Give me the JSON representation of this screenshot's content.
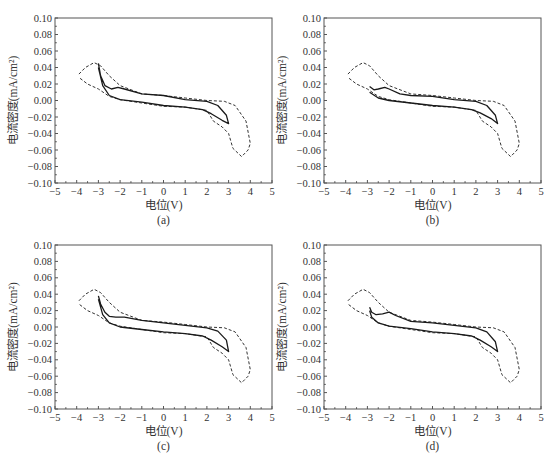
{
  "figure": {
    "axes_common": {
      "xlabel": "电位(V)",
      "ylabel": "电流密度(mA/cm²)",
      "xlim": [
        -5,
        5
      ],
      "ylim": [
        -0.1,
        0.1
      ],
      "x_ticks": [
        -5,
        -4,
        -3,
        -2,
        -1,
        0,
        1,
        2,
        3,
        4,
        5
      ],
      "x_tick_labels": [
        "−5",
        "−4",
        "−3",
        "−2",
        "−1",
        "0",
        "1",
        "2",
        "3",
        "4",
        "5"
      ],
      "y_ticks": [
        0.1,
        0.08,
        0.06,
        0.04,
        0.02,
        0.0,
        -0.02,
        -0.04,
        -0.06,
        -0.08,
        -0.1
      ],
      "y_tick_labels": [
        "0.10",
        "0.08",
        "0.06",
        "0.04",
        "0.02",
        "0.00",
        "−0.02",
        "−0.04",
        "−0.06",
        "−0.08",
        "−0.10"
      ]
    },
    "panels": [
      {
        "caption": "(a)"
      },
      {
        "caption": "(b)"
      },
      {
        "caption": "(c)"
      },
      {
        "caption": "(d)"
      }
    ]
  },
  "chart_data": [
    {
      "type": "line",
      "title": "(a)",
      "xlabel": "电位(V)",
      "ylabel": "电流密度(mA/cm²)",
      "xlim": [
        -5,
        5
      ],
      "ylim": [
        -0.1,
        0.1
      ],
      "grid": false,
      "legend": "none",
      "series": [
        {
          "name": "dashed",
          "style": "dashed",
          "x": [
            -3.9,
            -3.6,
            -3.2,
            -2.9,
            -2.5,
            -2.0,
            -1.0,
            0.0,
            1.0,
            2.0,
            2.8,
            3.3,
            3.8,
            4.0,
            3.9,
            3.6,
            3.2,
            3.0,
            2.7,
            2.3,
            2.0,
            1.0,
            0.0,
            -1.0,
            -2.0,
            -2.5,
            -3.0,
            -3.5,
            -3.9
          ],
          "y": [
            0.032,
            0.04,
            0.046,
            0.042,
            0.03,
            0.018,
            0.008,
            0.006,
            0.003,
            0.0,
            -0.001,
            -0.006,
            -0.025,
            -0.052,
            -0.06,
            -0.068,
            -0.058,
            -0.04,
            -0.032,
            -0.025,
            -0.012,
            -0.008,
            -0.007,
            -0.003,
            0.001,
            0.005,
            0.014,
            0.02,
            0.028
          ]
        },
        {
          "name": "solid",
          "style": "solid",
          "x": [
            -3.0,
            -2.9,
            -2.7,
            -2.4,
            -2.1,
            -1.8,
            -1.0,
            0.0,
            1.0,
            2.0,
            2.5,
            2.9,
            3.0,
            2.7,
            2.2,
            1.8,
            1.0,
            0.0,
            -1.0,
            -2.0,
            -2.5,
            -2.8,
            -3.0
          ],
          "y": [
            0.045,
            0.03,
            0.018,
            0.014,
            0.016,
            0.014,
            0.008,
            0.006,
            0.001,
            -0.001,
            -0.006,
            -0.018,
            -0.028,
            -0.024,
            -0.016,
            -0.011,
            -0.008,
            -0.006,
            -0.002,
            0.001,
            0.006,
            0.018,
            0.04
          ]
        }
      ]
    },
    {
      "type": "line",
      "title": "(b)",
      "xlabel": "电位(V)",
      "ylabel": "电流密度(mA/cm²)",
      "xlim": [
        -5,
        5
      ],
      "ylim": [
        -0.1,
        0.1
      ],
      "grid": false,
      "legend": "none",
      "series": [
        {
          "name": "dashed",
          "style": "dashed",
          "x": [
            -3.9,
            -3.6,
            -3.2,
            -2.9,
            -2.5,
            -2.0,
            -1.0,
            0.0,
            1.0,
            2.0,
            2.8,
            3.3,
            3.8,
            4.0,
            3.9,
            3.6,
            3.2,
            3.0,
            2.7,
            2.3,
            2.0,
            1.0,
            0.0,
            -1.0,
            -2.0,
            -2.5,
            -3.0,
            -3.5,
            -3.9
          ],
          "y": [
            0.032,
            0.04,
            0.046,
            0.042,
            0.03,
            0.018,
            0.008,
            0.006,
            0.003,
            0.0,
            -0.001,
            -0.006,
            -0.025,
            -0.052,
            -0.06,
            -0.068,
            -0.058,
            -0.04,
            -0.032,
            -0.025,
            -0.012,
            -0.008,
            -0.007,
            -0.003,
            0.001,
            0.005,
            0.014,
            0.02,
            0.028
          ]
        },
        {
          "name": "solid",
          "style": "solid",
          "x": [
            -2.9,
            -2.7,
            -2.5,
            -2.2,
            -2.0,
            -1.5,
            -1.0,
            0.0,
            1.0,
            2.0,
            2.5,
            2.9,
            3.0,
            2.7,
            2.2,
            1.8,
            1.0,
            0.0,
            -1.0,
            -2.0,
            -2.5,
            -2.9
          ],
          "y": [
            0.017,
            0.013,
            0.014,
            0.016,
            0.014,
            0.008,
            0.006,
            0.005,
            0.001,
            -0.001,
            -0.006,
            -0.018,
            -0.028,
            -0.022,
            -0.015,
            -0.011,
            -0.008,
            -0.006,
            -0.003,
            0.0,
            0.003,
            0.01
          ]
        }
      ]
    },
    {
      "type": "line",
      "title": "(c)",
      "xlabel": "电位(V)",
      "ylabel": "电流密度(mA/cm²)",
      "xlim": [
        -5,
        5
      ],
      "ylim": [
        -0.1,
        0.1
      ],
      "grid": false,
      "legend": "none",
      "series": [
        {
          "name": "dashed",
          "style": "dashed",
          "x": [
            -3.9,
            -3.6,
            -3.2,
            -2.9,
            -2.5,
            -2.0,
            -1.0,
            0.0,
            1.0,
            2.0,
            2.8,
            3.3,
            3.8,
            4.0,
            3.9,
            3.6,
            3.2,
            3.0,
            2.7,
            2.3,
            2.0,
            1.0,
            0.0,
            -1.0,
            -2.0,
            -2.5,
            -3.0,
            -3.5,
            -3.9
          ],
          "y": [
            0.032,
            0.04,
            0.046,
            0.042,
            0.03,
            0.018,
            0.008,
            0.006,
            0.003,
            0.0,
            -0.001,
            -0.006,
            -0.025,
            -0.052,
            -0.06,
            -0.068,
            -0.058,
            -0.04,
            -0.032,
            -0.025,
            -0.012,
            -0.008,
            -0.007,
            -0.003,
            0.001,
            0.005,
            0.014,
            0.02,
            0.028
          ]
        },
        {
          "name": "solid",
          "style": "solid",
          "x": [
            -3.0,
            -2.9,
            -2.7,
            -2.5,
            -2.2,
            -1.8,
            -1.0,
            0.0,
            1.0,
            2.0,
            2.5,
            2.9,
            3.0,
            2.7,
            2.2,
            1.8,
            1.0,
            0.0,
            -1.0,
            -2.0,
            -2.5,
            -2.8,
            -3.0
          ],
          "y": [
            0.038,
            0.028,
            0.018,
            0.013,
            0.012,
            0.012,
            0.008,
            0.005,
            0.002,
            -0.001,
            -0.005,
            -0.016,
            -0.03,
            -0.024,
            -0.016,
            -0.011,
            -0.008,
            -0.006,
            -0.003,
            0.0,
            0.005,
            0.015,
            0.034
          ]
        }
      ]
    },
    {
      "type": "line",
      "title": "(d)",
      "xlabel": "电位(V)",
      "ylabel": "电流密度(mA/cm²)",
      "xlim": [
        -5,
        5
      ],
      "ylim": [
        -0.1,
        0.1
      ],
      "grid": false,
      "legend": "none",
      "series": [
        {
          "name": "dashed",
          "style": "dashed",
          "x": [
            -3.9,
            -3.6,
            -3.2,
            -2.9,
            -2.5,
            -2.0,
            -1.0,
            0.0,
            1.0,
            2.0,
            2.8,
            3.3,
            3.8,
            4.0,
            3.9,
            3.6,
            3.2,
            3.0,
            2.7,
            2.3,
            2.0,
            1.0,
            0.0,
            -1.0,
            -2.0,
            -2.5,
            -3.0,
            -3.5,
            -3.9
          ],
          "y": [
            0.032,
            0.04,
            0.046,
            0.042,
            0.03,
            0.018,
            0.008,
            0.006,
            0.003,
            0.0,
            -0.001,
            -0.006,
            -0.025,
            -0.052,
            -0.06,
            -0.068,
            -0.058,
            -0.04,
            -0.032,
            -0.025,
            -0.012,
            -0.008,
            -0.007,
            -0.003,
            0.001,
            0.005,
            0.014,
            0.02,
            0.028
          ]
        },
        {
          "name": "solid",
          "style": "solid",
          "x": [
            -2.9,
            -2.8,
            -2.6,
            -2.3,
            -2.0,
            -1.7,
            -1.0,
            0.0,
            1.0,
            2.0,
            2.5,
            2.9,
            3.0,
            2.7,
            2.2,
            1.8,
            1.0,
            0.0,
            -1.0,
            -2.0,
            -2.5,
            -2.8,
            -2.9
          ],
          "y": [
            0.024,
            0.018,
            0.015,
            0.016,
            0.018,
            0.014,
            0.007,
            0.005,
            0.002,
            -0.001,
            -0.006,
            -0.018,
            -0.03,
            -0.024,
            -0.016,
            -0.011,
            -0.008,
            -0.006,
            -0.002,
            0.001,
            0.005,
            0.012,
            0.02
          ]
        }
      ]
    }
  ]
}
